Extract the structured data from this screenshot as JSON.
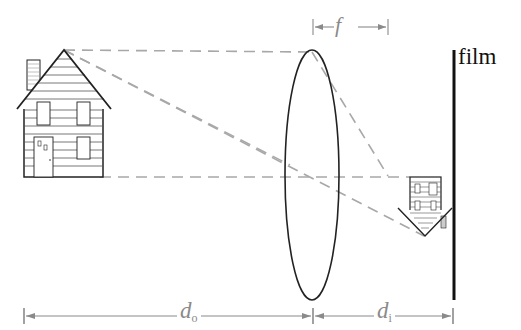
{
  "diagram": {
    "labels": {
      "film": "film",
      "focal_length": "f",
      "object_distance_main": "d",
      "object_distance_sub": "o",
      "image_distance_main": "d",
      "image_distance_sub": "i"
    },
    "elements": [
      {
        "id": "object-house",
        "description": "Upright house (object)"
      },
      {
        "id": "lens",
        "description": "Converging lens (ellipse)"
      },
      {
        "id": "image-house",
        "description": "Inverted, smaller house (image)"
      },
      {
        "id": "film-plane",
        "description": "Film plane (vertical thick line)"
      },
      {
        "id": "optical-axis",
        "description": "Dashed horizontal optical axis"
      },
      {
        "id": "rays",
        "description": "Dashed rays from roof peak through lens to image"
      }
    ],
    "colors": {
      "ink": "#222222",
      "ray": "#a8a8a8",
      "dimension": "#8a8a8a",
      "background": "#ffffff"
    }
  }
}
